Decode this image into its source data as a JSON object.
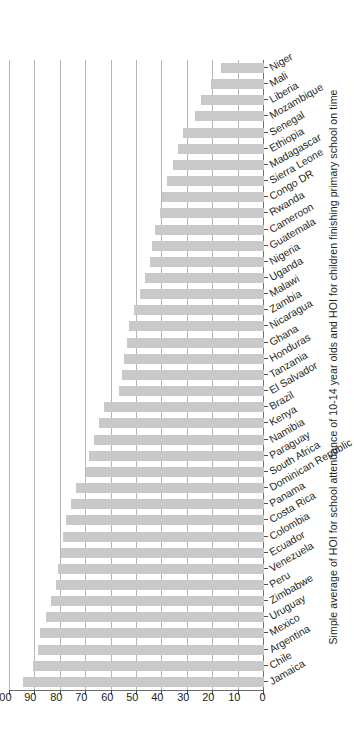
{
  "chart_data": {
    "type": "bar",
    "orientation": "horizontal-rotated",
    "title": "",
    "subtitle": "",
    "xlabel": "",
    "ylabel": "Simple average of HOI for school attendance of 10-14 year olds and HOI for children finishing primary school on time",
    "value_axis_label": "Simple average of HOI for school attendance of 10-14 year olds and HOI for children finishing primary school on time",
    "ylim": [
      0,
      100
    ],
    "value_axis_reversed": true,
    "grid": true,
    "legend": null,
    "bar_color": "#c9c9c9",
    "axis_color": "#6e6e6e",
    "gridline_color": "#b6b6b6",
    "tick_labels": [
      "100",
      "90",
      "80",
      "70",
      "60",
      "50",
      "40",
      "30",
      "20",
      "10",
      "0"
    ],
    "tick_values": [
      100,
      90,
      80,
      70,
      60,
      50,
      40,
      30,
      20,
      10,
      0
    ],
    "categories": [
      "Jamaica",
      "Chile",
      "Argentina",
      "Mexico",
      "Uruguay",
      "Zimbabwe",
      "Peru",
      "Venezuela",
      "Ecuador",
      "Colombia",
      "Costa Rica",
      "Panama",
      "Dominican Republic",
      "South Africa",
      "Paraguay",
      "Namibia",
      "Kenya",
      "Brazil",
      "El Salvador",
      "Tanzania",
      "Honduras",
      "Ghana",
      "Nicaragua",
      "Zambia",
      "Malawi",
      "Uganda",
      "Nigeria",
      "Guatemala",
      "Cameroon",
      "Rwanda",
      "Congo DR",
      "Sierra Leone",
      "Madagascar",
      "Ethiopia",
      "Senegal",
      "Mozambique",
      "Liberia",
      "Mali",
      "Niger"
    ],
    "values": [
      95,
      91,
      89,
      88,
      86,
      84,
      82,
      81,
      80,
      79,
      78,
      76,
      74,
      70,
      69,
      67,
      65,
      63,
      57,
      56,
      55,
      54,
      53,
      51,
      49,
      47,
      45,
      44,
      43,
      41,
      40,
      38,
      36,
      34,
      32,
      27,
      25,
      21,
      17
    ],
    "series": [
      {
        "name": "Simple average of HOI for school attendance of 10-14 year olds and HOI for children finishing primary school on time",
        "values": [
          95,
          91,
          89,
          88,
          86,
          84,
          82,
          81,
          80,
          79,
          78,
          76,
          74,
          70,
          69,
          67,
          65,
          63,
          57,
          56,
          55,
          54,
          53,
          51,
          49,
          47,
          45,
          44,
          43,
          41,
          40,
          38,
          36,
          34,
          32,
          27,
          25,
          21,
          17
        ]
      }
    ]
  }
}
